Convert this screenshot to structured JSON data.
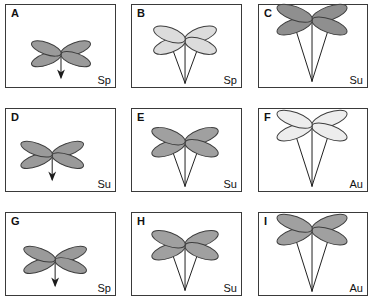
{
  "figure": {
    "type": "panel-grid",
    "rows": 3,
    "columns": 3,
    "background_color": "#ffffff",
    "border_color": "#3a3a3a"
  },
  "legend": {
    "codes": [
      "Sp",
      "Su",
      "Au"
    ]
  },
  "colors": {
    "petal_dark": "#9a9a9a",
    "petal_mid": "#a8a8a8",
    "petal_light": "#e8e8e8",
    "petal_pale": "#dcdcdc",
    "outline": "#3d3d3d",
    "stem": "#1b1b1b"
  },
  "panels": [
    {
      "id": "panel-a",
      "letter": "A",
      "code": "Sp",
      "x": 5,
      "y": 4,
      "width": 111,
      "height": 84,
      "flower_cx": 56,
      "flower_cy": 50,
      "petal_rx": 16,
      "petal_ry": 6,
      "petal_fill": "#9a9a9a",
      "stem_style": "arrow",
      "stem_length": 24,
      "stem_spread": 0,
      "arrow": true
    },
    {
      "id": "panel-b",
      "letter": "B",
      "code": "Sp",
      "x": 131,
      "y": 4,
      "width": 111,
      "height": 84,
      "flower_cx": 54,
      "flower_cy": 36,
      "petal_rx": 17,
      "petal_ry": 7,
      "petal_fill": "#dcdcdc",
      "stem_style": "v-pair",
      "stem_length": 44,
      "stem_spread": 14,
      "arrow": false
    },
    {
      "id": "panel-c",
      "letter": "C",
      "code": "Su",
      "x": 258,
      "y": 4,
      "width": 110,
      "height": 84,
      "flower_cx": 54,
      "flower_cy": 15,
      "petal_rx": 19,
      "petal_ry": 7,
      "petal_fill": "#8f8f8f",
      "stem_style": "v-pair",
      "stem_length": 63,
      "stem_spread": 18,
      "arrow": false
    },
    {
      "id": "panel-d",
      "letter": "D",
      "code": "Su",
      "x": 5,
      "y": 108,
      "width": 111,
      "height": 84,
      "flower_cx": 47,
      "flower_cy": 47,
      "petal_rx": 17,
      "petal_ry": 6,
      "petal_fill": "#9a9a9a",
      "stem_style": "arrow",
      "stem_length": 25,
      "stem_spread": 0,
      "arrow": true
    },
    {
      "id": "panel-e",
      "letter": "E",
      "code": "Su",
      "x": 131,
      "y": 108,
      "width": 111,
      "height": 84,
      "flower_cx": 54,
      "flower_cy": 34,
      "petal_rx": 18,
      "petal_ry": 7,
      "petal_fill": "#a0a0a0",
      "stem_style": "v-pair",
      "stem_length": 45,
      "stem_spread": 14,
      "arrow": false
    },
    {
      "id": "panel-f",
      "letter": "F",
      "code": "Au",
      "x": 258,
      "y": 108,
      "width": 110,
      "height": 84,
      "flower_cx": 54,
      "flower_cy": 17,
      "petal_rx": 19,
      "petal_ry": 7,
      "petal_fill": "#ededed",
      "stem_style": "v-pair",
      "stem_length": 62,
      "stem_spread": 18,
      "arrow": false
    },
    {
      "id": "panel-g",
      "letter": "G",
      "code": "Sp",
      "x": 5,
      "y": 212,
      "width": 111,
      "height": 84,
      "flower_cx": 50,
      "flower_cy": 48,
      "petal_rx": 17,
      "petal_ry": 6,
      "petal_fill": "#9a9a9a",
      "stem_style": "arrow",
      "stem_length": 26,
      "stem_spread": 0,
      "arrow": true
    },
    {
      "id": "panel-h",
      "letter": "H",
      "code": "Su",
      "x": 131,
      "y": 212,
      "width": 111,
      "height": 84,
      "flower_cx": 54,
      "flower_cy": 33,
      "petal_rx": 18,
      "petal_ry": 7,
      "petal_fill": "#a0a0a0",
      "stem_style": "v-pair",
      "stem_length": 46,
      "stem_spread": 14,
      "arrow": false
    },
    {
      "id": "panel-i",
      "letter": "I",
      "code": "Au",
      "x": 258,
      "y": 212,
      "width": 110,
      "height": 84,
      "flower_cx": 54,
      "flower_cy": 17,
      "petal_rx": 19,
      "petal_ry": 7,
      "petal_fill": "#a0a0a0",
      "stem_style": "v-pair",
      "stem_length": 63,
      "stem_spread": 18,
      "arrow": false
    }
  ]
}
